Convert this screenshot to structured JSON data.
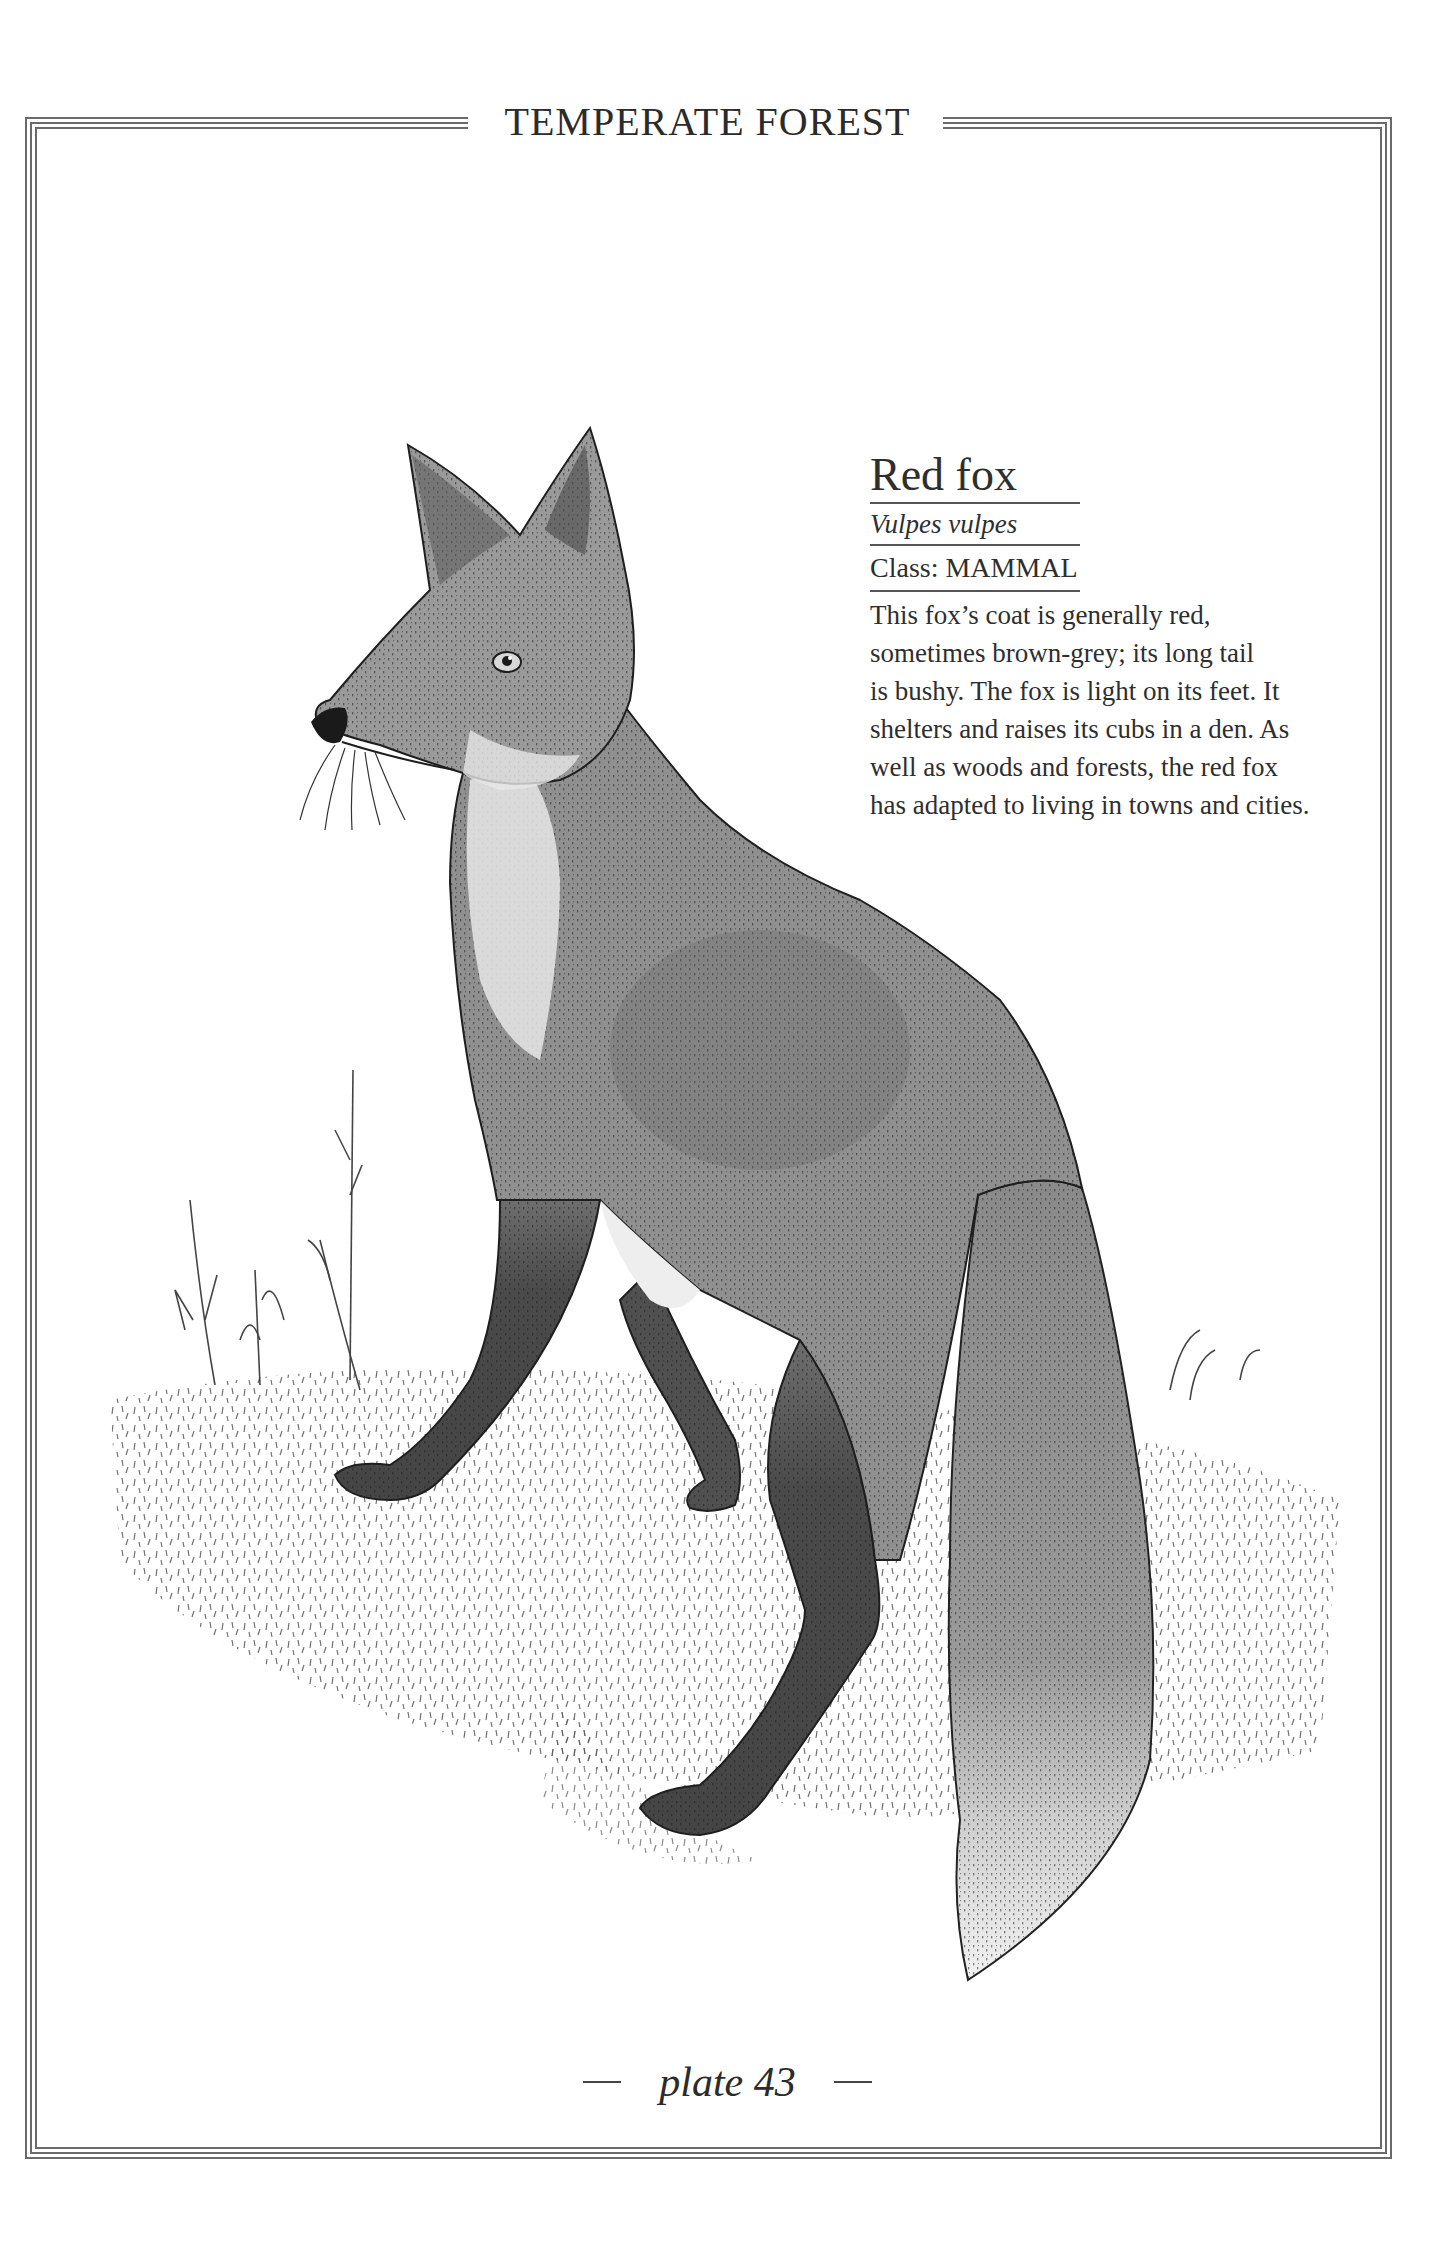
{
  "page": {
    "section_title": "TEMPERATE FOREST",
    "plate_label": "plate 43",
    "colors": {
      "ink": "#2a2a2a",
      "frame": "#6a6a6a",
      "fur_mid": "#8e8e8e",
      "fur_dark": "#4a4a4a",
      "background": "#ffffff"
    }
  },
  "entry": {
    "common_name": "Red fox",
    "latin_name": "Vulpes vulpes",
    "class_label": "Class: MAMMAL",
    "description_lines": [
      "This fox’s coat is generally red,",
      "sometimes brown-grey; its long tail",
      "is bushy. The fox is light on its feet. It",
      "shelters and raises its cubs in a den. As",
      "well as woods and forests, the red fox",
      "has adapted to living in towns and cities."
    ]
  },
  "illustration": {
    "subject": "red-fox-illustration",
    "style": "pen-and-ink stipple with grey wash"
  }
}
